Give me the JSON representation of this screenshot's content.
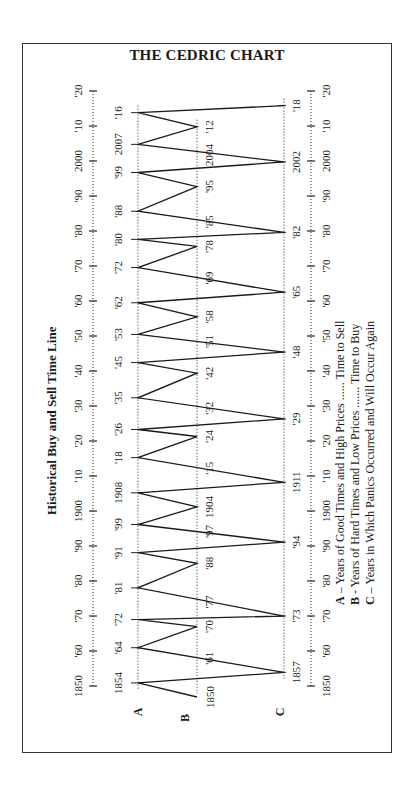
{
  "title": "THE CEDRIC CHART",
  "subtitle": "Historical Buy and Sell Time Line",
  "legend": [
    {
      "key": "A",
      "sep": "–",
      "text": "Years of Good Times and High Prices ...... Time to Sell"
    },
    {
      "key": "B",
      "sep": "-",
      "text": "Years of Hard Times and Low Prices ....... Time to Buy"
    },
    {
      "key": "C",
      "sep": "–",
      "text": "Years in Which Panics Occurred and Will Occur Again"
    }
  ],
  "axis": {
    "ticks": [
      {
        "year": 1850,
        "label": "1850"
      },
      {
        "year": 1860,
        "label": "'60"
      },
      {
        "year": 1870,
        "label": "'70"
      },
      {
        "year": 1880,
        "label": "'80"
      },
      {
        "year": 1890,
        "label": "'90"
      },
      {
        "year": 1900,
        "label": "1900"
      },
      {
        "year": 1910,
        "label": "'10"
      },
      {
        "year": 1920,
        "label": "'20"
      },
      {
        "year": 1930,
        "label": "'30"
      },
      {
        "year": 1940,
        "label": "'40"
      },
      {
        "year": 1950,
        "label": "'50"
      },
      {
        "year": 1960,
        "label": "'60"
      },
      {
        "year": 1970,
        "label": "'70"
      },
      {
        "year": 1980,
        "label": "'80"
      },
      {
        "year": 1990,
        "label": "'90"
      },
      {
        "year": 2000,
        "label": "2000"
      },
      {
        "year": 2010,
        "label": "'10"
      },
      {
        "year": 2020,
        "label": "'20"
      }
    ]
  },
  "chart_data": {
    "type": "line",
    "title": "THE CEDRIC CHART",
    "subtitle": "Historical Buy and Sell Time Line",
    "orientation": "rotated 90° (time runs bottom-to-top)",
    "xlabel": "Year",
    "x_range": [
      1850,
      2020
    ],
    "lanes": [
      {
        "key": "A",
        "meaning": "Years of Good Times and High Prices — Time to Sell",
        "years": [
          1854,
          1864,
          1872,
          1881,
          1891,
          1899,
          1908,
          1918,
          1926,
          1935,
          1945,
          1953,
          1962,
          1972,
          1980,
          1988,
          1999,
          2007,
          2016
        ]
      },
      {
        "key": "B",
        "meaning": "Years of Hard Times and Low Prices — Time to Buy",
        "years": [
          1850,
          1861,
          1870,
          1877,
          1888,
          1897,
          1904,
          1915,
          1924,
          1932,
          1942,
          1951,
          1958,
          1969,
          1978,
          1985,
          1995,
          2004,
          2012
        ]
      },
      {
        "key": "C",
        "meaning": "Years in Which Panics Occurred and Will Occur Again",
        "years": [
          1857,
          1873,
          1894,
          1911,
          1929,
          1948,
          1965,
          1982,
          2002,
          2018
        ]
      }
    ],
    "path": [
      {
        "lane": "B",
        "year": 1850,
        "label": "1850"
      },
      {
        "lane": "A",
        "year": 1854,
        "label": "1854"
      },
      {
        "lane": "C",
        "year": 1857,
        "label": "1857"
      },
      {
        "lane": "A",
        "year": 1864,
        "label": "'64"
      },
      {
        "lane": "B",
        "year": 1870,
        "label": "'70"
      },
      {
        "lane": "A",
        "year": 1872,
        "label": "'72"
      },
      {
        "lane": "C",
        "year": 1873,
        "label": "'73"
      },
      {
        "lane": "A",
        "year": 1881,
        "label": "'81"
      },
      {
        "lane": "B",
        "year": 1888,
        "label": "'88"
      },
      {
        "lane": "A",
        "year": 1891,
        "label": "'91"
      },
      {
        "lane": "C",
        "year": 1894,
        "label": "'94"
      },
      {
        "lane": "A",
        "year": 1899,
        "label": "'99"
      },
      {
        "lane": "B",
        "year": 1904,
        "label": "1904"
      },
      {
        "lane": "A",
        "year": 1908,
        "label": "1908"
      },
      {
        "lane": "C",
        "year": 1911,
        "label": "1911"
      },
      {
        "lane": "A",
        "year": 1918,
        "label": "'18"
      },
      {
        "lane": "B",
        "year": 1924,
        "label": "'24"
      },
      {
        "lane": "A",
        "year": 1926,
        "label": "'26"
      },
      {
        "lane": "C",
        "year": 1929,
        "label": "'29"
      },
      {
        "lane": "A",
        "year": 1935,
        "label": "'35"
      },
      {
        "lane": "B",
        "year": 1942,
        "label": "'42"
      },
      {
        "lane": "A",
        "year": 1945,
        "label": "'45"
      },
      {
        "lane": "C",
        "year": 1948,
        "label": "'48"
      },
      {
        "lane": "A",
        "year": 1953,
        "label": "'53"
      },
      {
        "lane": "B",
        "year": 1958,
        "label": "'58"
      },
      {
        "lane": "A",
        "year": 1962,
        "label": "'62"
      },
      {
        "lane": "C",
        "year": 1965,
        "label": "'65"
      },
      {
        "lane": "A",
        "year": 1972,
        "label": "'72"
      },
      {
        "lane": "B",
        "year": 1978,
        "label": "'78"
      },
      {
        "lane": "A",
        "year": 1980,
        "label": "'80"
      },
      {
        "lane": "C",
        "year": 1982,
        "label": "'82"
      },
      {
        "lane": "A",
        "year": 1988,
        "label": "'88"
      },
      {
        "lane": "B",
        "year": 1995,
        "label": "'95"
      },
      {
        "lane": "A",
        "year": 1999,
        "label": "'99"
      },
      {
        "lane": "C",
        "year": 2002,
        "label": "2002"
      },
      {
        "lane": "A",
        "year": 2007,
        "label": "2007"
      },
      {
        "lane": "B",
        "year": 2012,
        "label": "'12"
      },
      {
        "lane": "A",
        "year": 2016,
        "label": "'16"
      },
      {
        "lane": "C",
        "year": 2018,
        "label": "'18"
      }
    ],
    "crossing_labels": [
      {
        "lane": "B",
        "year": 1861,
        "label": "'61"
      },
      {
        "lane": "B",
        "year": 1877,
        "label": "'77"
      },
      {
        "lane": "B",
        "year": 1897,
        "label": "'97"
      },
      {
        "lane": "B",
        "year": 1915,
        "label": "'15"
      },
      {
        "lane": "B",
        "year": 1932,
        "label": "'32"
      },
      {
        "lane": "B",
        "year": 1951,
        "label": "'51"
      },
      {
        "lane": "B",
        "year": 1969,
        "label": "'69"
      },
      {
        "lane": "B",
        "year": 1985,
        "label": "'85"
      },
      {
        "lane": "B",
        "year": 2004,
        "label": "2004"
      }
    ],
    "legend": [
      "A – Years of Good Times and High Prices ...... Time to Sell",
      "B - Years of Hard Times and Low Prices ....... Time to Buy",
      "C – Years in Which Panics Occurred and Will Occur Again"
    ],
    "grid": false
  }
}
